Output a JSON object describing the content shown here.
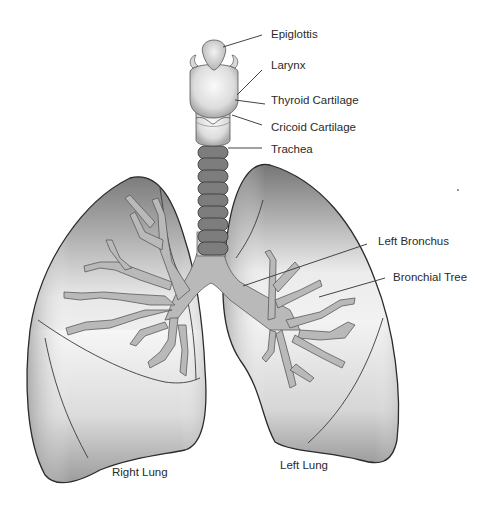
{
  "diagram": {
    "labels": {
      "epiglottis": "Epiglottis",
      "larynx": "Larynx",
      "thyroid_cartilage": "Thyroid Cartilage",
      "cricoid_cartilage": "Cricoid Cartilage",
      "trachea": "Trachea",
      "left_bronchus": "Left Bronchus",
      "bronchial_tree": "Bronchial Tree",
      "right_lung": "Right Lung",
      "left_lung": "Left Lung"
    },
    "colors": {
      "lung_dark": "#6f6f6f",
      "lung_light": "#f4f4f4",
      "bronchi": "#b9b9b9",
      "trachea_rings": "#7d7d7d",
      "outline": "#2b2b2b",
      "label_text": "#2a2a2a"
    }
  }
}
